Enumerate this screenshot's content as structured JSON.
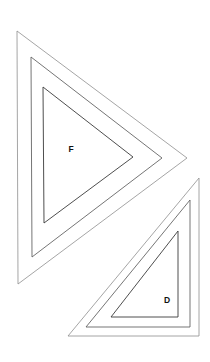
{
  "page": {
    "width": 210,
    "height": 362,
    "background_color": "#ffffff"
  },
  "style": {
    "stroke_outer": "#8e8e8e",
    "stroke_middle": "#5c5c5c",
    "stroke_inner": "#3a3a3a",
    "label_color": "#111111"
  },
  "figures": [
    {
      "id": "figure-f",
      "label": "F",
      "label_position": {
        "x": 71,
        "y": 150
      },
      "orientation": "left-pointing-right-apex",
      "rings": [
        {
          "name": "outer",
          "points": "17,31 187,158 18,284",
          "stroke": "#8e8e8e"
        },
        {
          "name": "middle",
          "points": "31,57 162,158 32,257",
          "stroke": "#5c5c5c"
        },
        {
          "name": "inner",
          "points": "43,87 133,157 44,223",
          "stroke": "#3a3a3a"
        }
      ]
    },
    {
      "id": "figure-d",
      "label": "D",
      "label_position": {
        "x": 167,
        "y": 301
      },
      "orientation": "right-angle-lower-right",
      "rings": [
        {
          "name": "outer",
          "points": "199,178 199,336 68,336",
          "stroke": "#8e8e8e"
        },
        {
          "name": "middle",
          "points": "190,200 190,327 86,327",
          "stroke": "#5c5c5c"
        },
        {
          "name": "inner",
          "points": "178,231 178,317 111,317",
          "stroke": "#3a3a3a"
        }
      ]
    }
  ],
  "labels": {
    "f": "F",
    "d": "D"
  }
}
